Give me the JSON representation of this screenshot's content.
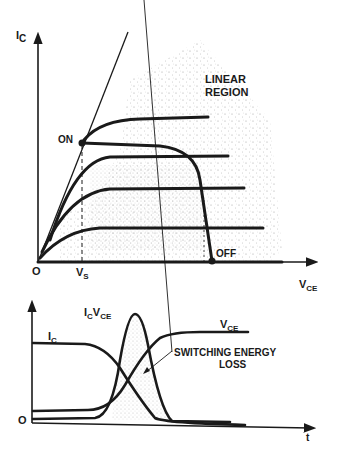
{
  "top_diagram": {
    "y_axis_label": "I",
    "y_axis_sub": "C",
    "x_axis_label": "V",
    "x_axis_sub": "CE",
    "origin_label": "O",
    "vs_label": "V",
    "vs_sub": "S",
    "on_label": "ON",
    "off_label": "OFF",
    "region_label_line1": "LINEAR",
    "region_label_line2": "REGION"
  },
  "bottom_diagram": {
    "ic_label": "I",
    "ic_sub": "C",
    "icvce_label": "I",
    "icvce_sub1": "C",
    "icvce_mid": "V",
    "icvce_sub2": "CE",
    "vce_label": "V",
    "vce_sub": "CE",
    "loss_label_line1": "SWITCHING ENERGY",
    "loss_label_line2": "LOSS",
    "origin_label": "O",
    "time_label": "t"
  },
  "colors": {
    "ink": "#1a1a1a",
    "stipple": "#8a8a8a",
    "background": "#ffffff"
  }
}
